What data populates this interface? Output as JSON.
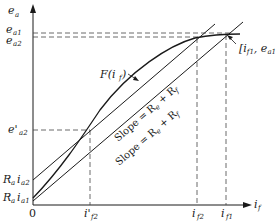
{
  "diagram": {
    "type": "magnetization-characteristic",
    "axes": {
      "y_label": "e",
      "y_label_sub": "a",
      "x_label": "i",
      "x_label_sub": "f",
      "origin_label": "0"
    },
    "y_ticks": [
      {
        "main": "e",
        "sub": "a1"
      },
      {
        "main": "e",
        "sub": "a2"
      },
      {
        "main": "e'",
        "sub": "a2"
      },
      {
        "main": "R",
        "sub": "a",
        "main2": "i",
        "sub2": "a2"
      },
      {
        "main": "R",
        "sub": "a",
        "main2": "i",
        "sub2": "a1"
      }
    ],
    "x_ticks": [
      {
        "main": "i'",
        "sub": "f2"
      },
      {
        "main": "i",
        "sub": "f2"
      },
      {
        "main": "i",
        "sub": "f1"
      }
    ],
    "curve_label": "F(i",
    "curve_label_sub": "f",
    "curve_label_end": ")",
    "slope_labels": [
      "Slope = R",
      "Slope = R"
    ],
    "slope_sub": "e",
    "slope_rest": " + R",
    "slope_rest_sub": "f",
    "point_label": {
      "open": "[i",
      "sub1": "f1",
      "sep": ", e",
      "sub2": "a1"
    },
    "colors": {
      "line": "#1a1a1a",
      "dashed": "#444444",
      "background": "#ffffff"
    }
  }
}
